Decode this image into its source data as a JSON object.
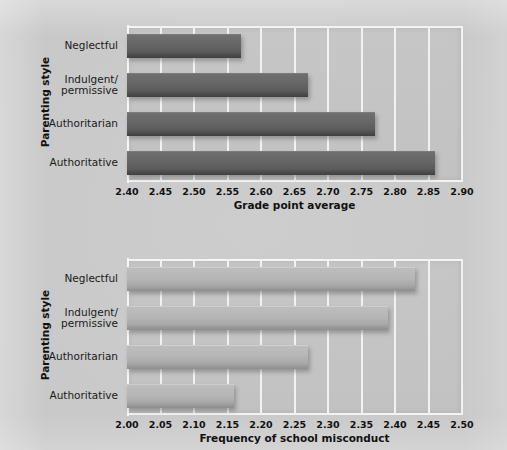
{
  "chart_data": [
    {
      "type": "bar",
      "orientation": "horizontal",
      "title": "",
      "xlabel": "Grade point average",
      "ylabel": "Parenting style",
      "categories": [
        "Neglectful",
        "Indulgent/\npermissive",
        "Authoritarian",
        "Authoritative"
      ],
      "category_lines": [
        [
          "Neglectful"
        ],
        [
          "Indulgent/",
          "permissive"
        ],
        [
          "Authoritarian"
        ],
        [
          "Authoritative"
        ]
      ],
      "values": [
        2.57,
        2.67,
        2.77,
        2.86
      ],
      "xlim": [
        2.4,
        2.9
      ],
      "xticks": [
        "2.40",
        "2.45",
        "2.50",
        "2.55",
        "2.60",
        "2.65",
        "2.70",
        "2.75",
        "2.80",
        "2.85",
        "2.90"
      ],
      "xtick_values": [
        2.4,
        2.45,
        2.5,
        2.55,
        2.6,
        2.65,
        2.7,
        2.75,
        2.8,
        2.85,
        2.9
      ],
      "grid": true,
      "grid_color": "#f2f2f2",
      "bar_color": "#666666",
      "plot_background": "#c4c4c4",
      "legend": null
    },
    {
      "type": "bar",
      "orientation": "horizontal",
      "title": "",
      "xlabel": "Frequency of school misconduct",
      "ylabel": "Parenting style",
      "categories": [
        "Neglectful",
        "Indulgent/\npermissive",
        "Authoritarian",
        "Authoritative"
      ],
      "category_lines": [
        [
          "Neglectful"
        ],
        [
          "Indulgent/",
          "permissive"
        ],
        [
          "Authoritarian"
        ],
        [
          "Authoritative"
        ]
      ],
      "values": [
        2.43,
        2.39,
        2.27,
        2.16
      ],
      "xlim": [
        2.0,
        2.5
      ],
      "xticks": [
        "2.00",
        "2.05",
        "2.10",
        "2.15",
        "2.20",
        "2.25",
        "2.30",
        "2.35",
        "2.40",
        "2.45",
        "2.50"
      ],
      "xtick_values": [
        2.0,
        2.05,
        2.1,
        2.15,
        2.2,
        2.25,
        2.3,
        2.35,
        2.4,
        2.45,
        2.5
      ],
      "grid": true,
      "grid_color": "#f2f2f2",
      "bar_color": "#b6b6b6",
      "plot_background": "#c4c4c4",
      "legend": null
    }
  ],
  "page": {
    "background": "#c8c8c8"
  }
}
